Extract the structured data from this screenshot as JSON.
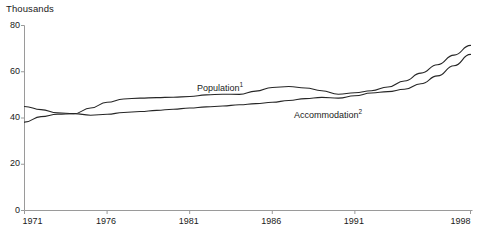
{
  "chart_data": {
    "type": "line",
    "title": "",
    "ylabel": "Thousands",
    "xlabel": "",
    "ylim": [
      0,
      80
    ],
    "xlim": [
      1971,
      1998
    ],
    "grid": false,
    "legend_position": "inline-annotation",
    "y_ticks": [
      "0",
      "20",
      "40",
      "60",
      "80"
    ],
    "y_tick_values": [
      0,
      20,
      40,
      60,
      80
    ],
    "x_ticks": [
      "1971",
      "1976",
      "1981",
      "1986",
      "1991",
      "1998"
    ],
    "x_tick_values": [
      1971,
      1976,
      1981,
      1986,
      1991,
      1998
    ],
    "x": [
      1971,
      1972,
      1973,
      1974,
      1975,
      1976,
      1977,
      1978,
      1979,
      1980,
      1981,
      1982,
      1983,
      1984,
      1985,
      1986,
      1987,
      1988,
      1989,
      1990,
      1991,
      1992,
      1993,
      1994,
      1995,
      1996,
      1997,
      1998
    ],
    "series": [
      {
        "name": "Population",
        "footnote_marker": "1",
        "color": "#262626",
        "values": [
          45.0,
          43.6,
          42.2,
          41.9,
          44.3,
          46.8,
          48.2,
          48.6,
          48.8,
          49.0,
          49.3,
          50.0,
          50.3,
          50.2,
          51.6,
          53.2,
          53.6,
          53.0,
          51.8,
          50.3,
          50.9,
          51.8,
          53.4,
          56.0,
          59.4,
          63.0,
          67.2,
          71.4
        ]
      },
      {
        "name": "Accommodation",
        "footnote_marker": "2",
        "color": "#262626",
        "values": [
          38.2,
          40.6,
          41.6,
          41.9,
          41.2,
          41.6,
          42.4,
          42.8,
          43.3,
          43.8,
          44.3,
          44.8,
          45.2,
          45.7,
          46.2,
          46.8,
          47.6,
          48.4,
          48.9,
          48.6,
          49.6,
          50.8,
          51.4,
          52.4,
          54.8,
          58.2,
          62.6,
          67.5
        ]
      }
    ],
    "annotations": [
      {
        "text": "Population",
        "marker": "1",
        "x_px": 197,
        "y_px": 83
      },
      {
        "text": "Accommodation",
        "marker": "2",
        "x_px": 294,
        "y_px": 110
      }
    ]
  },
  "axes": {
    "unit_label": "Thousands"
  }
}
